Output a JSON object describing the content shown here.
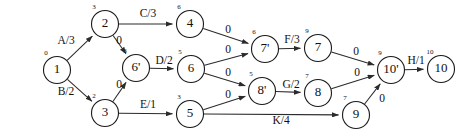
{
  "diagram": {
    "type": "activity-network",
    "canvas": {
      "width": 463,
      "height": 135
    },
    "node_radius": 13.5,
    "nodes": [
      {
        "id": "n1",
        "label": "1",
        "value": "0",
        "x": 57,
        "y": 70
      },
      {
        "id": "n2",
        "label": "2",
        "value": "3",
        "x": 105,
        "y": 24
      },
      {
        "id": "n3",
        "label": "3",
        "value": "2",
        "x": 105,
        "y": 113
      },
      {
        "id": "n6p",
        "label": "6'",
        "value": "3",
        "x": 136,
        "y": 68
      },
      {
        "id": "n4",
        "label": "4",
        "value": "6",
        "x": 190,
        "y": 24
      },
      {
        "id": "n6",
        "label": "6",
        "value": "5",
        "x": 191,
        "y": 69
      },
      {
        "id": "n5",
        "label": "5",
        "value": "3",
        "x": 190,
        "y": 114
      },
      {
        "id": "n7p",
        "label": "7'",
        "value": "6",
        "x": 265,
        "y": 49
      },
      {
        "id": "n8p",
        "label": "8'",
        "value": "5",
        "x": 262,
        "y": 91
      },
      {
        "id": "n7",
        "label": "7",
        "value": "9",
        "x": 318,
        "y": 48
      },
      {
        "id": "n8",
        "label": "8",
        "value": "7",
        "x": 318,
        "y": 93
      },
      {
        "id": "n9",
        "label": "9",
        "value": "7",
        "x": 356,
        "y": 115
      },
      {
        "id": "n10p",
        "label": "10'",
        "value": "9",
        "x": 391,
        "y": 70
      },
      {
        "id": "n10",
        "label": "10",
        "value": "10",
        "x": 441,
        "y": 69
      }
    ],
    "edges": [
      {
        "id": "e1",
        "from": "n1",
        "to": "n2",
        "label": "A/3",
        "lx": 66,
        "ly": 41
      },
      {
        "id": "e2",
        "from": "n1",
        "to": "n3",
        "label": "B/2",
        "lx": 66,
        "ly": 92
      },
      {
        "id": "e3",
        "from": "n2",
        "to": "n4",
        "label": "C/3",
        "lx": 148,
        "ly": 14
      },
      {
        "id": "e4",
        "from": "n2",
        "to": "n6p",
        "label": "0",
        "lx": 119,
        "ly": 41
      },
      {
        "id": "e5",
        "from": "n3",
        "to": "n6p",
        "label": "0",
        "lx": 119,
        "ly": 85
      },
      {
        "id": "e6",
        "from": "n6p",
        "to": "n6",
        "label": "D/2",
        "lx": 164,
        "ly": 61
      },
      {
        "id": "e7",
        "from": "n3",
        "to": "n5",
        "label": "E/1",
        "lx": 148,
        "ly": 105
      },
      {
        "id": "e8",
        "from": "n4",
        "to": "n7p",
        "label": "0",
        "lx": 228,
        "ly": 30
      },
      {
        "id": "e9",
        "from": "n6",
        "to": "n7p",
        "label": "0",
        "lx": 228,
        "ly": 50
      },
      {
        "id": "e10",
        "from": "n6",
        "to": "n8p",
        "label": "0",
        "lx": 228,
        "ly": 73
      },
      {
        "id": "e11",
        "from": "n5",
        "to": "n8p",
        "label": "0",
        "lx": 228,
        "ly": 95
      },
      {
        "id": "e12",
        "from": "n7p",
        "to": "n7",
        "label": "F/3",
        "lx": 292,
        "ly": 40
      },
      {
        "id": "e13",
        "from": "n8p",
        "to": "n8",
        "label": "G/2",
        "lx": 291,
        "ly": 85
      },
      {
        "id": "e14",
        "from": "n7",
        "to": "n10p",
        "label": "0",
        "lx": 356,
        "ly": 52
      },
      {
        "id": "e15",
        "from": "n8",
        "to": "n10p",
        "label": "0",
        "lx": 357,
        "ly": 73
      },
      {
        "id": "e16",
        "from": "n9",
        "to": "n10p",
        "label": "0",
        "lx": 382,
        "ly": 99
      },
      {
        "id": "e17",
        "from": "n5",
        "to": "n9",
        "label": "K/4",
        "lx": 281,
        "ly": 121
      },
      {
        "id": "e18",
        "from": "n10p",
        "to": "n10",
        "label": "H/1",
        "lx": 416,
        "ly": 61
      }
    ]
  }
}
